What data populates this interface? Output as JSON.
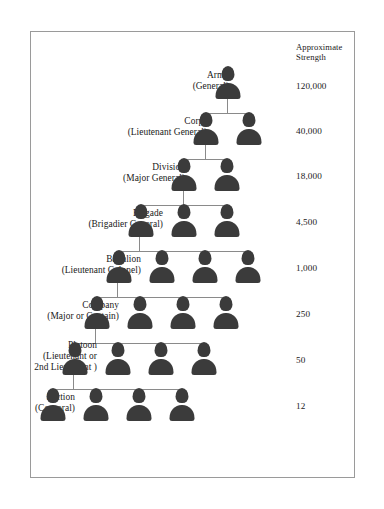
{
  "diagram": {
    "strength_column": {
      "header": "Approximate\nStrength"
    },
    "levels": [
      {
        "unit": "Army",
        "commander": "(General)",
        "label": "Army\n(General)",
        "strength": "120,000",
        "units_shown": 1
      },
      {
        "unit": "Corps",
        "commander": "(Lieutenant General)",
        "label": "Corps\n(Lieutenant General)",
        "strength": "40,000",
        "units_shown": 2
      },
      {
        "unit": "Division",
        "commander": "(Major General)",
        "label": "Division\n(Major General)",
        "strength": "18,000",
        "units_shown": 2
      },
      {
        "unit": "Brigade",
        "commander": "(Brigadier General)",
        "label": "Brigade\n(Brigadier General)",
        "strength": "4,500",
        "units_shown": 3
      },
      {
        "unit": "Battalion",
        "commander": "(Lieutenant Colonel)",
        "label": "Battalion\n(Lieutenant Colonel)",
        "strength": "1,000",
        "units_shown": 4
      },
      {
        "unit": "Company",
        "commander": "(Major or Captain)",
        "label": "Company\n(Major or Captain)",
        "strength": "250",
        "units_shown": 4
      },
      {
        "unit": "Platoon",
        "commander": "(Lieutenant or 2nd Lieutenant )",
        "label": "Platoon\n(Lieutenant or\n2nd Lieutenant )",
        "strength": "50",
        "units_shown": 4
      },
      {
        "unit": "Section",
        "commander": "(Corporal)",
        "label": "Section\n(Corporal)",
        "strength": "12",
        "units_shown": 4
      }
    ],
    "colors": {
      "figure": "#3b3b3b",
      "connector": "#8a8a8a",
      "border": "#9a9a9a",
      "background": "#ffffff",
      "text": "#1a1a1a"
    }
  }
}
